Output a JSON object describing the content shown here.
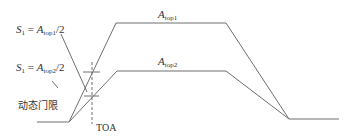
{
  "diagram": {
    "type": "signal-timing",
    "colors": {
      "line": "#6e6e6e",
      "text": "#333333",
      "background": "#ffffff"
    },
    "labels": {
      "s1_top1": {
        "var": "S",
        "var_sub": "1",
        "eq": " = ",
        "amp": "A",
        "amp_sub": "top1",
        "tail": "/2"
      },
      "s1_top2": {
        "var": "S",
        "var_sub": "1",
        "eq": " = ",
        "amp": "A",
        "amp_sub": "top2",
        "tail": "/2"
      },
      "a_top1": {
        "amp": "A",
        "amp_sub": "top1"
      },
      "a_top2": {
        "amp": "A",
        "amp_sub": "top2"
      },
      "threshold": "动态门限",
      "toa": "TOA"
    },
    "pulses": [
      {
        "name": "A_top1",
        "points": [
          [
            69,
            122
          ],
          [
            116,
            23
          ],
          [
            226,
            23
          ],
          [
            289,
            119
          ]
        ]
      },
      {
        "name": "A_top2",
        "points": [
          [
            69,
            122
          ],
          [
            117,
            71
          ],
          [
            226,
            71
          ],
          [
            289,
            119
          ]
        ]
      }
    ],
    "baseline_left": [
      [
        37,
        122
      ],
      [
        69,
        122
      ]
    ],
    "baseline_right": [
      [
        289,
        119
      ],
      [
        339,
        119
      ]
    ]
  }
}
